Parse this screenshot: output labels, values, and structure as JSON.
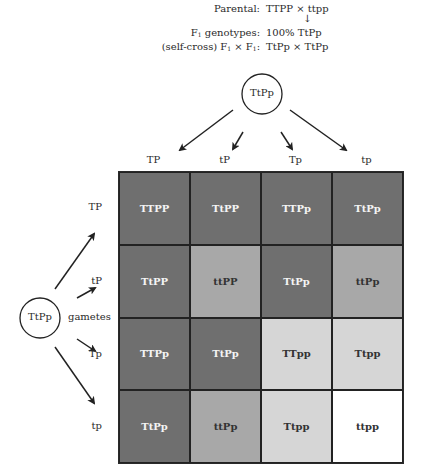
{
  "header": {
    "parental_label": "Parental:",
    "parental_value": "TTPP × ttpp",
    "arrow": "↓",
    "f1_label_prefix": "F",
    "f1_label_sub": "1",
    "f1_label_suffix": " genotypes:",
    "f1_value": "100% TtPp",
    "cross_label_prefix": "(self-cross) F",
    "cross_label_sub1": "1",
    "cross_label_mid": " × F",
    "cross_label_sub2": "1",
    "cross_label_suffix": ":",
    "cross_value": "TtPp × TtPp"
  },
  "top_parent": {
    "genotype": "TtPp"
  },
  "left_parent": {
    "genotype": "TtPp",
    "gametes_label": "gametes"
  },
  "column_gametes": [
    "TP",
    "tP",
    "Tp",
    "tp"
  ],
  "row_gametes": [
    "TP",
    "tP",
    "Tp",
    "tp"
  ],
  "colors": {
    "dark": "#6f6f6f",
    "medium": "#a8a8a8",
    "light": "#d6d6d6",
    "white": "#ffffff",
    "line": "#222222"
  },
  "grid": [
    [
      {
        "genotype": "TTPP",
        "shade": "dark"
      },
      {
        "genotype": "TtPP",
        "shade": "dark"
      },
      {
        "genotype": "TTPp",
        "shade": "dark"
      },
      {
        "genotype": "TtPp",
        "shade": "dark"
      }
    ],
    [
      {
        "genotype": "TtPP",
        "shade": "dark"
      },
      {
        "genotype": "ttPP",
        "shade": "medium"
      },
      {
        "genotype": "TtPp",
        "shade": "dark"
      },
      {
        "genotype": "ttPp",
        "shade": "medium"
      }
    ],
    [
      {
        "genotype": "TTPp",
        "shade": "dark"
      },
      {
        "genotype": "TtPp",
        "shade": "dark"
      },
      {
        "genotype": "TTpp",
        "shade": "light"
      },
      {
        "genotype": "Ttpp",
        "shade": "light"
      }
    ],
    [
      {
        "genotype": "TtPp",
        "shade": "dark"
      },
      {
        "genotype": "ttPp",
        "shade": "medium"
      },
      {
        "genotype": "Ttpp",
        "shade": "light"
      },
      {
        "genotype": "ttpp",
        "shade": "white"
      }
    ]
  ]
}
